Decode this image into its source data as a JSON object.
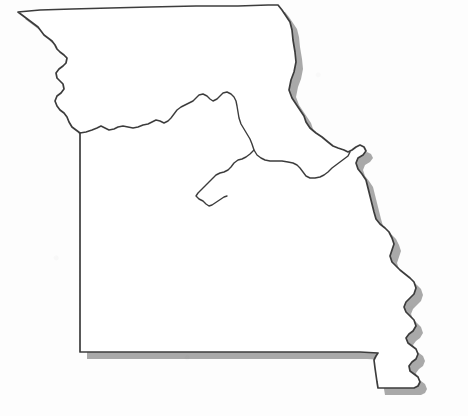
{
  "figure": {
    "kind": "outline-map",
    "caption": "",
    "title": "",
    "width": 468,
    "height": 416,
    "background_color": "#fdfdfd",
    "has_labels": false,
    "has_legend": false,
    "has_scale_bar": false,
    "has_compass": false
  },
  "style": {
    "outline_color": "#3c3c3c",
    "outline_width": 1.7,
    "interior_fill": "#ffffff",
    "shadow_color": "#9a9a9a",
    "shadow_opacity": 0.85,
    "shadow_offset_x": 7,
    "shadow_offset_y": 7,
    "river_line_color": "#3c3c3c",
    "river_line_width": 1.4
  },
  "features": [
    {
      "name": "state-outline",
      "type": "polygon",
      "label": "Missouri state boundary"
    },
    {
      "name": "missouri-river",
      "type": "polyline",
      "label": "Missouri River"
    }
  ],
  "boundary_segments": [
    {
      "name": "north-border",
      "label": "Iowa border (straight)",
      "orientation": "horizontal"
    },
    {
      "name": "northwest-border",
      "label": "Missouri River / Nebraska border",
      "orientation": "diagonal"
    },
    {
      "name": "west-border",
      "label": "Kansas border (straight meridian)",
      "orientation": "vertical"
    },
    {
      "name": "south-border",
      "label": "Arkansas border (straight parallel)",
      "orientation": "horizontal"
    },
    {
      "name": "east-border",
      "label": "Mississippi River / Illinois-Kentucky-Tennessee border",
      "orientation": "sinuous"
    },
    {
      "name": "bootheel",
      "label": "Missouri Bootheel",
      "orientation": "southern-projection"
    }
  ]
}
